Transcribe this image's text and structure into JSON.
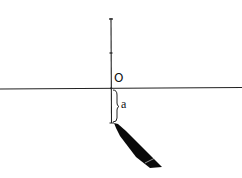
{
  "diagram": {
    "type": "coordinate-number-line-with-pen",
    "labels": {
      "origin": "O",
      "distance": "a"
    },
    "elements": [
      {
        "name": "horizontal-axis",
        "description": "Horizontal line across the page"
      },
      {
        "name": "vertical-axis",
        "description": "Vertical line through origin with tick marks above"
      },
      {
        "name": "origin-label",
        "text": "O"
      },
      {
        "name": "distance-brace",
        "text": "a",
        "description": "Brace marking distance a below origin"
      },
      {
        "name": "pen",
        "description": "Pen tip touching the point at distance a below the origin"
      }
    ],
    "colors": {
      "ink": "#111111",
      "background": "#ffffff"
    }
  }
}
